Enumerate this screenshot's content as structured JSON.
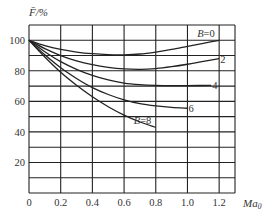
{
  "chart_data": {
    "type": "line",
    "title": "",
    "xlabel": "Ma0",
    "ylabel": "F̄/%",
    "xlim": [
      0,
      1.3
    ],
    "ylim": [
      0,
      110
    ],
    "grid": true,
    "x_ticks": [
      "0",
      "0.2",
      "0.4",
      "0.6",
      "0.8",
      "1.0",
      "1.2"
    ],
    "y_ticks": [
      "20",
      "40",
      "60",
      "80",
      "100"
    ],
    "x_gridlines": [
      0,
      0.2,
      0.4,
      0.6,
      0.8,
      1.0,
      1.2,
      1.3
    ],
    "y_gridlines": [
      0,
      10,
      20,
      30,
      40,
      50,
      60,
      70,
      80,
      90,
      100,
      110
    ],
    "series": [
      {
        "name": "B=0",
        "label": "B=0",
        "x": [
          0,
          0.1,
          0.2,
          0.3,
          0.4,
          0.5,
          0.6,
          0.7,
          0.8,
          0.9,
          1.0,
          1.1,
          1.2
        ],
        "values": [
          100,
          96.5,
          94,
          92.3,
          91.2,
          90.6,
          90.5,
          91,
          92.3,
          94,
          96,
          98,
          100
        ]
      },
      {
        "name": "B=2",
        "label": "2",
        "x": [
          0,
          0.1,
          0.2,
          0.3,
          0.4,
          0.5,
          0.6,
          0.7,
          0.8,
          0.9,
          1.0,
          1.1,
          1.2
        ],
        "values": [
          100,
          94.5,
          90,
          86.5,
          84,
          82.3,
          81.3,
          81,
          81.5,
          82.7,
          84.3,
          86.2,
          88
        ]
      },
      {
        "name": "B=4",
        "label": "4",
        "x": [
          0,
          0.1,
          0.2,
          0.3,
          0.4,
          0.5,
          0.6,
          0.7,
          0.8,
          0.9,
          1.0,
          1.15
        ],
        "values": [
          100,
          92.5,
          86,
          81,
          77,
          74,
          72,
          71,
          70.5,
          70.3,
          70.3,
          70.5
        ]
      },
      {
        "name": "B=6",
        "label": "6",
        "x": [
          0,
          0.1,
          0.2,
          0.3,
          0.4,
          0.5,
          0.6,
          0.7,
          0.8,
          0.9,
          1.0
        ],
        "values": [
          100,
          90.5,
          82,
          75,
          69,
          64.5,
          61,
          58.5,
          57,
          56,
          55.5
        ]
      },
      {
        "name": "B=8",
        "label": "B=8",
        "x": [
          0,
          0.1,
          0.2,
          0.3,
          0.4,
          0.5,
          0.6,
          0.7,
          0.8
        ],
        "values": [
          100,
          89,
          79,
          70.5,
          63,
          56.5,
          51,
          46.5,
          43
        ]
      }
    ]
  }
}
